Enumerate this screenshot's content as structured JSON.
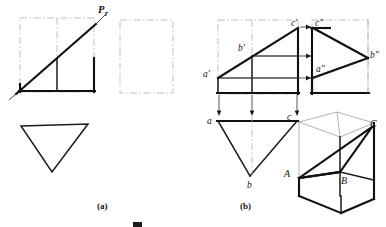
{
  "figure": {
    "title_bar_present": true,
    "parts": [
      {
        "id": "part-a",
        "label": "(a)"
      },
      {
        "id": "part-b",
        "label": "(b)"
      }
    ],
    "caption": {
      "visible_text": "",
      "note": "caption row clipped at bottom edge of image"
    }
  },
  "panel_a": {
    "name": "projection-plane-diagram",
    "trace_label": "Pr",
    "trace_label_parts": {
      "base": "P",
      "subscript": "r"
    },
    "shapes": {
      "front_square": {
        "x": 20,
        "y": 18,
        "w": 74,
        "h": 74,
        "center_divider_x": 57
      },
      "side_rect": {
        "x": 120,
        "y": 20,
        "w": 53,
        "h": 73
      },
      "top_triangle": {
        "apex_x": 52,
        "apex_y": 172,
        "left_x": 21,
        "right_x": 88,
        "top_y": 125
      }
    },
    "oblique_line": {
      "x1": 9,
      "y1": 98,
      "x2": 107,
      "y2": 13
    }
  },
  "panel_b": {
    "name": "three-view-and-pictorial",
    "front_view": {
      "name": "front-view",
      "box": {
        "x": 218,
        "y": 20,
        "w": 80,
        "h": 74
      },
      "center_divider_x": 252,
      "labels": [
        {
          "text": "a'",
          "x": 206,
          "y": 74
        },
        {
          "text": "b'",
          "x": 240,
          "y": 50
        },
        {
          "text": "c'",
          "x": 293,
          "y": 27
        }
      ]
    },
    "side_view": {
      "name": "side-view",
      "box": {
        "x": 312,
        "y": 20,
        "w": 56,
        "h": 73
      },
      "labels": [
        {
          "text": "c\"",
          "x": 316,
          "y": 27
        },
        {
          "text": "a\"",
          "x": 318,
          "y": 71
        },
        {
          "text": "b\"",
          "x": 370,
          "y": 57
        }
      ]
    },
    "top_view": {
      "name": "top-view",
      "labels": [
        {
          "text": "a",
          "x": 209,
          "y": 126
        },
        {
          "text": "c",
          "x": 288,
          "y": 124
        },
        {
          "text": "b",
          "x": 246,
          "y": 185
        }
      ],
      "triangle": {
        "left_x": 218,
        "right_x": 297,
        "top_y": 121,
        "apex_x": 250,
        "apex_y": 176
      }
    },
    "pictorial": {
      "name": "isometric-prism",
      "labels": [
        {
          "text": "A",
          "x": 285,
          "y": 173
        },
        {
          "text": "B",
          "x": 342,
          "y": 180
        },
        {
          "text": "C",
          "x": 371,
          "y": 129
        }
      ]
    },
    "projector_arrows": {
      "horizontal_count": 3,
      "vertical_count": 3
    }
  }
}
